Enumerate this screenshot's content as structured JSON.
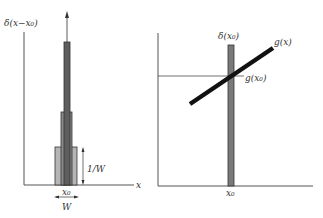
{
  "colors": {
    "axis": "#555555",
    "bar_outer": "#b0b0b0",
    "bar_mid": "#8a8a8a",
    "bar_inner": "#5e5e5e",
    "line": "#111111"
  },
  "left_panel": {
    "ylabel": "δ(x−x₀)",
    "xlabel": "x",
    "height_label": "1/W",
    "center_label": "x₀",
    "width_label": "W"
  },
  "right_panel": {
    "delta_label": "δ(x₀)",
    "function_label": "g(x)",
    "value_label": "g(x₀)",
    "center_label": "x₀"
  }
}
